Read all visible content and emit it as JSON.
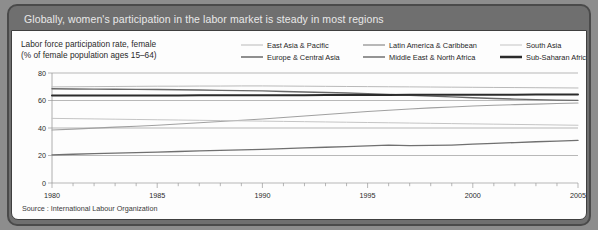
{
  "header": {
    "title": "Globally, women's participation in the labor market is steady in most regions"
  },
  "footer": {
    "source": "Source : International Labour Organization"
  },
  "axis_caption": {
    "line1": "Labor force participation rate, female",
    "line2": "(% of female population ages 15–64)"
  },
  "colors": {
    "panel": "#6f6f6f",
    "panel_border": "#4a4a4a",
    "card": "#fdfdfd",
    "title_text": "#e9e9e9",
    "axis": "#9a9a9a",
    "east_asia_pacific": "#b9b9b9",
    "europe_central_asia": "#6a6a6a",
    "latin_america_caribbean": "#a0a0a0",
    "middle_east_north_africa": "#707070",
    "south_asia": "#c4c4c4",
    "sub_saharan_africa": "#2b2b2b"
  },
  "chart_data": {
    "type": "line",
    "title": "Globally, women's participation in the labor market is steady in most regions",
    "subtitle": "Labor force participation rate, female (% of female population ages 15–64)",
    "xlabel": "",
    "ylabel": "Labor force participation rate, female (% of female population ages 15–64)",
    "xlim": [
      1980,
      2005
    ],
    "ylim": [
      0,
      80
    ],
    "yticks": [
      0,
      20,
      40,
      60,
      80
    ],
    "xticks": [
      1980,
      1985,
      1990,
      1995,
      2000,
      2005
    ],
    "xtick_labels": [
      "1980",
      "1985",
      "1990",
      "1995",
      "2000",
      "2005"
    ],
    "ytick_labels": [
      "0",
      "20",
      "40",
      "60",
      "80"
    ],
    "minor_xticks_every": 1,
    "grid": true,
    "grid_axis": "y",
    "legend_position": "top",
    "x": [
      1980,
      1981,
      1982,
      1983,
      1984,
      1985,
      1986,
      1987,
      1988,
      1989,
      1990,
      1991,
      1992,
      1993,
      1994,
      1995,
      1996,
      1997,
      1998,
      1999,
      2000,
      2001,
      2002,
      2003,
      2004,
      2005
    ],
    "series": [
      {
        "name": "East Asia & Pacific",
        "color": "#b9b9b9",
        "width": 1.0,
        "values": [
          69.9,
          70.0,
          70.1,
          70.2,
          70.3,
          70.4,
          70.4,
          70.5,
          70.5,
          70.6,
          70.6,
          70.5,
          70.4,
          70.3,
          70.2,
          70.1,
          70.0,
          69.9,
          69.8,
          69.7,
          69.6,
          69.5,
          69.4,
          69.3,
          69.2,
          69.1
        ]
      },
      {
        "name": "Europe & Central Asia",
        "color": "#6a6a6a",
        "width": 1.4,
        "values": [
          68.5,
          68.4,
          68.3,
          68.2,
          68.1,
          68.0,
          67.8,
          67.6,
          67.4,
          67.2,
          67.0,
          66.6,
          66.2,
          65.8,
          65.4,
          65.0,
          64.4,
          63.8,
          63.2,
          62.6,
          62.0,
          61.5,
          61.0,
          60.6,
          60.3,
          60.1
        ]
      },
      {
        "name": "Latin America & Caribbean",
        "color": "#a0a0a0",
        "width": 1.1,
        "values": [
          38.5,
          39.2,
          39.9,
          40.6,
          41.3,
          42.0,
          42.9,
          43.8,
          44.7,
          45.6,
          46.5,
          47.6,
          48.7,
          49.8,
          50.9,
          52.0,
          52.9,
          53.8,
          54.6,
          55.3,
          56.0,
          56.5,
          57.0,
          57.4,
          57.8,
          58.2
        ]
      },
      {
        "name": "Middle East & North Africa",
        "color": "#707070",
        "width": 1.3,
        "values": [
          20.5,
          20.9,
          21.3,
          21.7,
          22.1,
          22.5,
          22.9,
          23.3,
          23.7,
          24.1,
          24.5,
          25.0,
          25.5,
          26.0,
          26.5,
          27.0,
          27.6,
          27.2,
          27.3,
          27.6,
          28.2,
          28.8,
          29.4,
          30.0,
          30.5,
          31.0
        ]
      },
      {
        "name": "South Asia",
        "color": "#c4c4c4",
        "width": 1.0,
        "values": [
          47.0,
          46.8,
          46.6,
          46.4,
          46.2,
          46.0,
          45.8,
          45.6,
          45.4,
          45.2,
          45.0,
          44.8,
          44.6,
          44.4,
          44.2,
          44.0,
          43.8,
          43.6,
          43.4,
          43.2,
          43.0,
          42.8,
          42.6,
          42.4,
          42.2,
          42.0
        ]
      },
      {
        "name": "Sub-Saharan Africa",
        "color": "#2b2b2b",
        "width": 2.0,
        "values": [
          63.6,
          63.6,
          63.6,
          63.6,
          63.7,
          63.7,
          63.7,
          63.8,
          63.8,
          63.8,
          63.9,
          63.9,
          63.9,
          64.0,
          64.0,
          64.0,
          64.0,
          64.1,
          64.1,
          64.1,
          64.2,
          64.2,
          64.2,
          64.3,
          64.3,
          64.3
        ]
      }
    ]
  }
}
